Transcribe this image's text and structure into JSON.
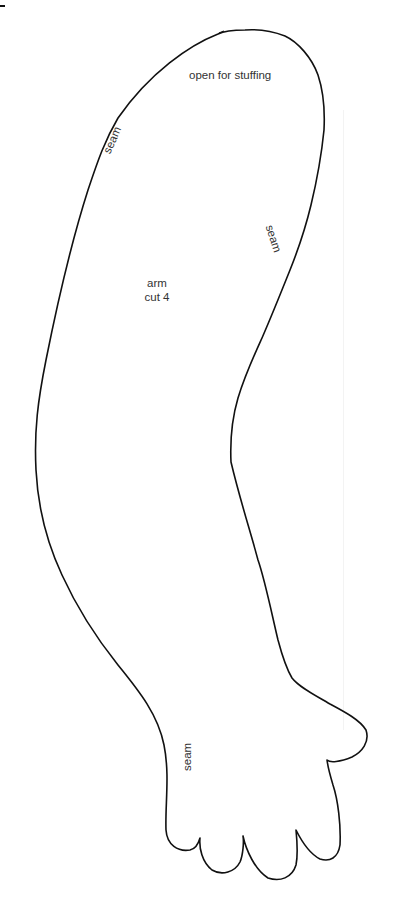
{
  "pattern": {
    "piece_name": "arm",
    "cut_instruction": "cut 4",
    "labels": {
      "opening": "open for stuffing",
      "seam_upper_left": "seam",
      "seam_upper_right": "seam",
      "seam_wrist": "seam"
    },
    "colors": {
      "outline": "#111111",
      "text": "#333333",
      "background": "#ffffff"
    }
  }
}
